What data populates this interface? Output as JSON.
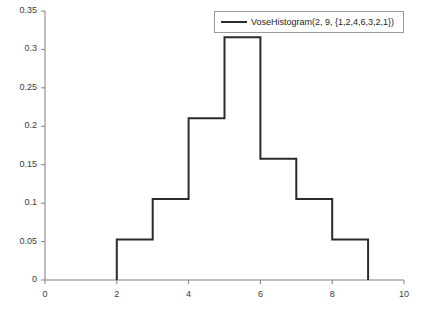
{
  "chart_data": {
    "type": "bar",
    "title": "",
    "subtitle": "",
    "xlabel": "",
    "ylabel": "",
    "xlim": [
      0,
      10
    ],
    "ylim": [
      0,
      0.35
    ],
    "grid": false,
    "legend_position": "top-right",
    "style": "step-outline",
    "series": [
      {
        "name": "VoseHistogram(2, 9, {1,2,4,6,3,2,1})",
        "color": "#2b2b2b",
        "bin_edges": [
          2,
          3,
          4,
          5,
          6,
          7,
          8,
          9
        ],
        "weights": [
          1,
          2,
          4,
          6,
          3,
          2,
          1
        ],
        "values": [
          0.0526,
          0.1053,
          0.2105,
          0.3158,
          0.1579,
          0.1053,
          0.0526
        ],
        "bins": [
          {
            "from": 2,
            "to": 3,
            "density": 0.0526
          },
          {
            "from": 3,
            "to": 4,
            "density": 0.1053
          },
          {
            "from": 4,
            "to": 5,
            "density": 0.2105
          },
          {
            "from": 5,
            "to": 6,
            "density": 0.3158
          },
          {
            "from": 6,
            "to": 7,
            "density": 0.1579
          },
          {
            "from": 7,
            "to": 8,
            "density": 0.1053
          },
          {
            "from": 8,
            "to": 9,
            "density": 0.0526
          }
        ]
      }
    ],
    "xticks": [
      {
        "value": 0,
        "label": "0"
      },
      {
        "value": 2,
        "label": "2"
      },
      {
        "value": 4,
        "label": "4"
      },
      {
        "value": 6,
        "label": "6"
      },
      {
        "value": 8,
        "label": "8"
      },
      {
        "value": 10,
        "label": "10"
      }
    ],
    "yticks": [
      {
        "value": 0,
        "label": "0"
      },
      {
        "value": 0.05,
        "label": "0.05"
      },
      {
        "value": 0.1,
        "label": "0.1"
      },
      {
        "value": 0.15,
        "label": "0.15"
      },
      {
        "value": 0.2,
        "label": "0.2"
      },
      {
        "value": 0.25,
        "label": "0.25"
      },
      {
        "value": 0.3,
        "label": "0.3"
      },
      {
        "value": 0.35,
        "label": "0.35"
      }
    ]
  },
  "legend": {
    "entries": [
      {
        "label": "VoseHistogram(2, 9, {1,2,4,6,3,2,1})",
        "color": "#2b2b2b"
      }
    ]
  },
  "colors": {
    "curve": "#2b2b2b",
    "axis": "#808080",
    "tick_text": "#3c3c3c",
    "legend_border": "#9a9a9a",
    "background": "#ffffff"
  }
}
